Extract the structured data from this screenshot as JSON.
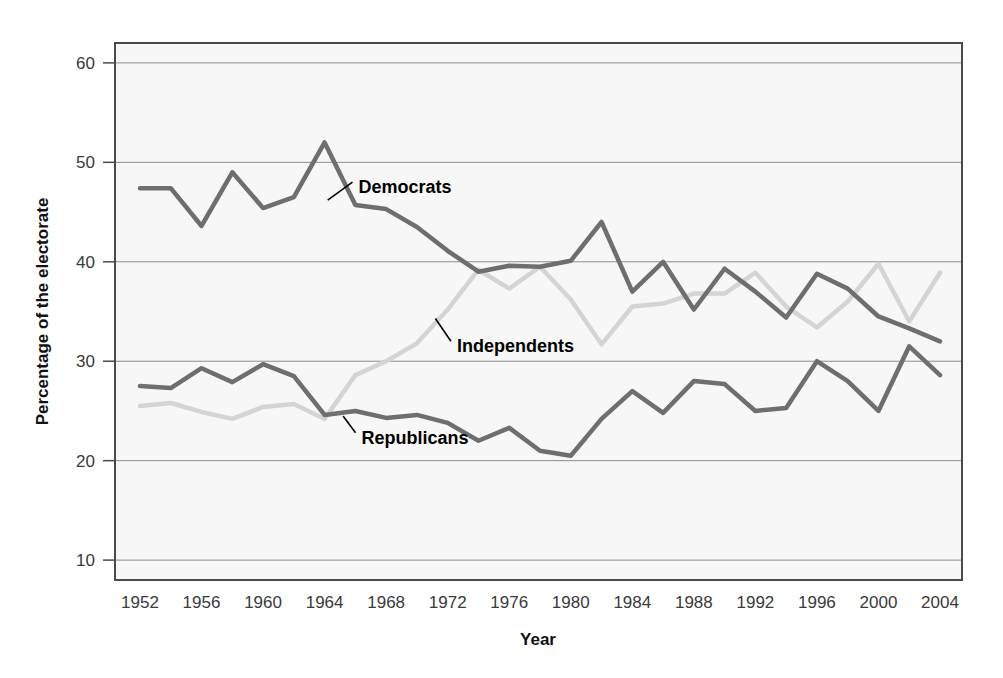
{
  "chart_data": {
    "type": "line",
    "title": "",
    "xlabel": "Year",
    "ylabel": "Percentage of the electorate",
    "xlim": [
      1952,
      2004
    ],
    "ylim": [
      8,
      62
    ],
    "ytick_labels": [
      "60",
      "50",
      "40",
      "30",
      "20",
      "10"
    ],
    "yticks": [
      60,
      50,
      40,
      30,
      20,
      10
    ],
    "grid": "horizontal",
    "legend_position": "inline-annotations",
    "x": [
      1952,
      1954,
      1956,
      1958,
      1960,
      1962,
      1964,
      1966,
      1968,
      1970,
      1972,
      1974,
      1976,
      1978,
      1980,
      1982,
      1984,
      1986,
      1988,
      1990,
      1992,
      1994,
      1996,
      1998,
      2000,
      2002,
      2004
    ],
    "series": [
      {
        "name": "Democrats",
        "color": "#6e6e6e",
        "values": [
          47.4,
          47.4,
          43.6,
          49.0,
          45.4,
          46.5,
          52.0,
          45.7,
          45.3,
          43.5,
          41.1,
          39.0,
          39.6,
          39.5,
          40.1,
          44.0,
          37.0,
          40.0,
          35.2,
          39.3,
          37.0,
          34.4,
          38.8,
          37.3,
          34.5,
          33.3,
          32.0
        ]
      },
      {
        "name": "Independents",
        "color": "#d4d4d4",
        "values": [
          25.5,
          25.8,
          24.9,
          24.2,
          25.4,
          25.7,
          24.2,
          28.6,
          30.0,
          31.8,
          35.2,
          39.2,
          37.3,
          39.5,
          36.2,
          31.7,
          35.5,
          35.8,
          36.8,
          36.8,
          38.9,
          35.5,
          33.4,
          36.0,
          39.8,
          34.0,
          38.9
        ]
      },
      {
        "name": "Republicans",
        "color": "#6e6e6e",
        "values": [
          27.5,
          27.3,
          29.3,
          27.9,
          29.7,
          28.5,
          24.6,
          25.0,
          24.3,
          24.6,
          23.8,
          22.0,
          23.3,
          21.0,
          20.5,
          24.2,
          27.0,
          24.8,
          28.0,
          27.7,
          25.0,
          25.3,
          30.0,
          28.0,
          25.0,
          31.5,
          28.6
        ]
      }
    ],
    "annotations": [
      {
        "name": "democrats-label",
        "text": "Democrats",
        "x": 1966.2,
        "y": 47.5,
        "leader_from_x": 1964.2,
        "leader_from_y": 46.2
      },
      {
        "name": "independents-label",
        "text": "Independents",
        "x": 1972.6,
        "y": 31.5,
        "leader_from_x": 1971.2,
        "leader_from_y": 34.3
      },
      {
        "name": "republicans-label",
        "text": "Republicans",
        "x": 1966.4,
        "y": 22.3,
        "leader_from_x": 1965.2,
        "leader_from_y": 24.5
      }
    ]
  },
  "xtick_labels": [
    "1952",
    "1956",
    "1960",
    "1964",
    "1968",
    "1972",
    "1976",
    "1980",
    "1984",
    "1988",
    "1992",
    "1996",
    "2000",
    "2004"
  ],
  "xticks": [
    1952,
    1956,
    1960,
    1964,
    1968,
    1972,
    1976,
    1980,
    1984,
    1988,
    1992,
    1996,
    2000,
    2004
  ],
  "colors": {
    "plot_background": "#f7f7f7",
    "plot_border": "#4a4a4a",
    "gridline": "#8c8c8c",
    "dark_series": "#6e6e6e",
    "light_series": "#d4d4d4",
    "text": "#3a3a3a"
  }
}
